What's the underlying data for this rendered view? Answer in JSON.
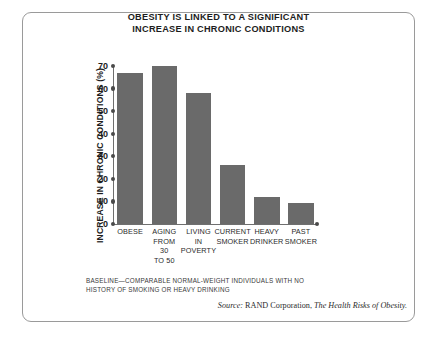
{
  "chart_data": {
    "type": "bar",
    "title": "OBESITY IS LINKED TO A SIGNIFICANT INCREASE IN CHRONIC CONDITIONS",
    "title_lines": [
      "OBESITY IS LINKED TO A SIGNIFICANT",
      "INCREASE IN CHRONIC CONDITIONS"
    ],
    "xlabel": "",
    "ylabel": "INCREASE IN CHRONIC CONDITIONS (%)",
    "ylim": [
      0,
      70
    ],
    "ytick_values": [
      0,
      10,
      20,
      30,
      40,
      50,
      60,
      70
    ],
    "ytick_labels": [
      "0",
      "10",
      "20",
      "30",
      "40",
      "50",
      "60",
      "70"
    ],
    "grid": false,
    "legend": "none",
    "categories": [
      "OBESE",
      "AGING FROM 30 TO 50",
      "LIVING IN POVERTY",
      "CURRENT SMOKER",
      "HEAVY DRINKER",
      "PAST SMOKER"
    ],
    "category_label_lines": [
      [
        "OBESE"
      ],
      [
        "AGING",
        "FROM",
        "30",
        "TO 50"
      ],
      [
        "LIVING",
        "IN",
        "POVERTY"
      ],
      [
        "CURRENT",
        "SMOKER"
      ],
      [
        "HEAVY",
        "DRINKER"
      ],
      [
        "PAST",
        "SMOKER"
      ]
    ],
    "values": [
      67,
      70,
      58,
      26,
      12,
      9.5
    ],
    "bar_color": "#6a6a6a",
    "axis_color": "#6f6f6f"
  },
  "footnote": {
    "lines": [
      "BASELINE—COMPARABLE NORMAL-WEIGHT INDIVIDUALS WITH NO",
      "HISTORY OF SMOKING OR HEAVY DRINKING"
    ]
  },
  "source": {
    "label": "Source:",
    "organization": " RAND Corporation, ",
    "publication": "The Health Risks of Obesity."
  }
}
